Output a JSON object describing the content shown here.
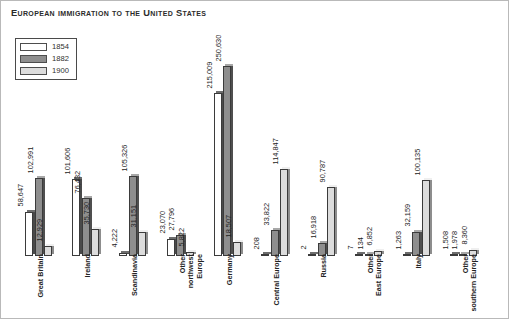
{
  "title": "European immigration to the United States",
  "legend": {
    "position": "top-left",
    "entries": [
      {
        "label": "1854",
        "color": "#ffffff"
      },
      {
        "label": "1882",
        "color": "#8e8e8e"
      },
      {
        "label": "1900",
        "color": "#dcdcdc"
      }
    ]
  },
  "chart_data": {
    "type": "bar",
    "title": "European immigration to the United States",
    "xlabel": "",
    "ylabel": "",
    "grid": false,
    "legend_position": "top-left",
    "ylim": [
      0,
      250630
    ],
    "categories": [
      "Great Britain",
      "Ireland",
      "Scandinavia",
      "Other northwest Europe",
      "Germany",
      "Central Europe",
      "Russia",
      "Other East Europe",
      "Italy",
      "Other southern Europe"
    ],
    "series": [
      {
        "name": "1854",
        "values": [
          58647,
          101606,
          4222,
          23070,
          215009,
          208,
          2,
          7,
          1263,
          1508
        ],
        "labels": [
          "58,647",
          "101,606",
          "4,222",
          "23,070",
          "215,009",
          "208",
          "2",
          "7",
          "1,263",
          "1,508"
        ]
      },
      {
        "name": "1882",
        "values": [
          102991,
          76432,
          105326,
          27796,
          250630,
          33822,
          16918,
          134,
          32159,
          1978
        ],
        "labels": [
          "102,991",
          "76,432",
          "105,326",
          "27,796",
          "250,630",
          "33,822",
          "16,918",
          "134",
          "32,159",
          "1,978"
        ]
      },
      {
        "name": "1900",
        "values": [
          12929,
          35730,
          31151,
          5822,
          18507,
          114847,
          90787,
          6852,
          100135,
          8360
        ],
        "labels": [
          "12,929",
          "35,730",
          "31,151",
          "5,822",
          "18,507",
          "114,847",
          "90,787",
          "6,852",
          "100,135",
          "8,360"
        ]
      }
    ]
  }
}
